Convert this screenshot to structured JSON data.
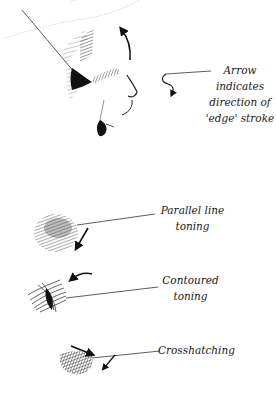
{
  "figure": {
    "colors": {
      "ink": "#1a1a1a",
      "line": "#333333",
      "background": "#ffffff"
    },
    "annotations": [
      {
        "id": "arrow",
        "lines": [
          "Arrow",
          "indicates",
          "direction of",
          "'edge' stroke"
        ]
      },
      {
        "id": "parallel",
        "lines": [
          "Parallel line",
          "toning"
        ]
      },
      {
        "id": "contoured",
        "lines": [
          "Contoured",
          "toning"
        ]
      },
      {
        "id": "crosshatching",
        "lines": [
          "Crosshatching"
        ]
      }
    ]
  }
}
